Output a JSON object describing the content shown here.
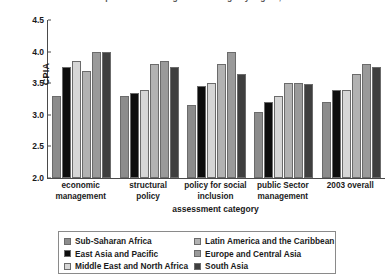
{
  "chart_data": {
    "type": "bar",
    "title": "Comparison of average CPIA ratings by region, 2003",
    "xlabel": "assessment category",
    "ylabel": "CPIA",
    "ylim": [
      2.0,
      4.5
    ],
    "yticks": [
      "2.0",
      "2.5",
      "3.0",
      "3.5",
      "4.0",
      "4.5"
    ],
    "grid": false,
    "legend_position": "bottom",
    "categories": [
      "economic management",
      "structural policy",
      "policy for social inclusion",
      "public Sector management",
      "2003 overall"
    ],
    "category_lines": [
      [
        "economic",
        "management"
      ],
      [
        "structural",
        "policy"
      ],
      [
        "policy for social",
        "inclusion"
      ],
      [
        "public Sector",
        "management"
      ],
      [
        "2003 overall",
        ""
      ]
    ],
    "series": [
      {
        "name": "Sub-Saharan Africa",
        "color": "#8c8c8c",
        "values": [
          3.3,
          3.3,
          3.15,
          3.05,
          3.2
        ]
      },
      {
        "name": "East Asia and Pacific",
        "color": "#0d0d0d",
        "values": [
          3.75,
          3.35,
          3.45,
          3.2,
          3.4
        ]
      },
      {
        "name": "Middle East and North Africa",
        "color": "#d6d6d6",
        "values": [
          3.85,
          3.4,
          3.5,
          3.3,
          3.4
        ]
      },
      {
        "name": "Latin America and the Caribbean",
        "color": "#b2b2b2",
        "values": [
          3.7,
          3.8,
          3.8,
          3.5,
          3.65
        ]
      },
      {
        "name": "Europe and Central Asia",
        "color": "#9a9a9a",
        "values": [
          4.0,
          3.85,
          4.0,
          3.5,
          3.8
        ]
      },
      {
        "name": "South Asia",
        "color": "#3f3f3f",
        "values": [
          3.99,
          3.75,
          3.65,
          3.48,
          3.75
        ]
      }
    ]
  }
}
